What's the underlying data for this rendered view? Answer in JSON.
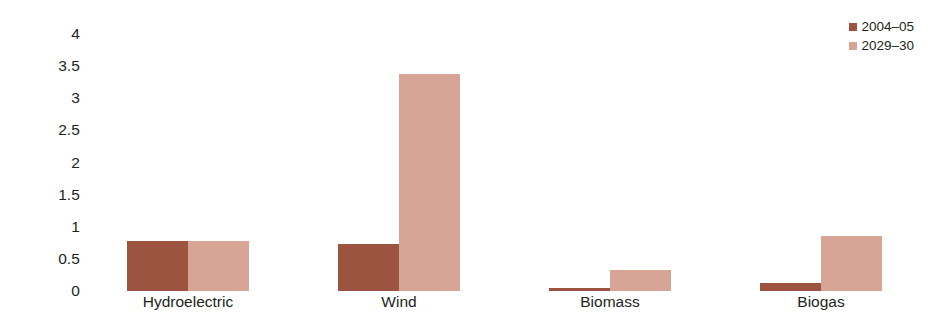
{
  "chart_data": {
    "type": "bar",
    "title": "",
    "subtitle": "",
    "xlabel": "",
    "ylabel": "",
    "categories": [
      "Hydroelectric",
      "Wind",
      "Biomass",
      "Biogas"
    ],
    "series": [
      {
        "name": "2004–05",
        "color": "#9c5340",
        "values": [
          0.78,
          0.73,
          0.04,
          0.13
        ]
      },
      {
        "name": "2029–30",
        "color": "#d6a595",
        "values": [
          0.78,
          3.38,
          0.33,
          0.85
        ]
      }
    ],
    "ylim": [
      0,
      4
    ],
    "yticks": [
      0,
      0.5,
      1,
      1.5,
      2,
      2.5,
      3,
      3.5,
      4
    ],
    "ytick_labels": [
      "0",
      "0.5",
      "1",
      "1.5",
      "2",
      "2.5",
      "3",
      "3.5",
      "4"
    ],
    "grid": false,
    "legend_position": "top-right",
    "legend_entries": [
      "2004–05",
      "2029–30"
    ],
    "annotations": []
  }
}
